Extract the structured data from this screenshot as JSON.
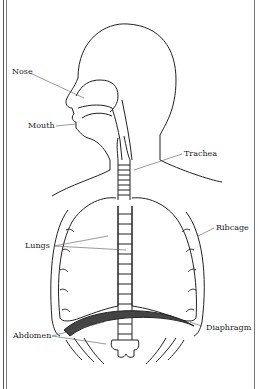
{
  "diagram": {
    "labels": {
      "nose": "Nose",
      "mouth": "Mouth",
      "trachea": "Trachea",
      "ribcage": "Ribcage",
      "lungs": "Lungs",
      "diaphragm": "Diaphragm",
      "abdomen": "Abdomen"
    },
    "colors": {
      "line": "#222222",
      "background": "#ffffff",
      "diaphragm_fill": "#444444"
    }
  }
}
